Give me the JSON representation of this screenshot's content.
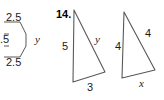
{
  "figure": {
    "kind": "geometry-diagram",
    "background_color": "#ffffff",
    "line_color": "#4d4d4d",
    "text_color": "#1a1a1a",
    "problem_number": "14."
  },
  "left_partial_figure": {
    "description": "polygon cropped by the left page edge",
    "labels": {
      "top_side": "2.5",
      "middle_side": ".5",
      "bottom_side": "2.5",
      "variable": "y"
    }
  },
  "triangle_one": {
    "labels": {
      "left_side": "5",
      "hypotenuse": "y",
      "base": "3"
    }
  },
  "triangle_two": {
    "labels": {
      "left_side": "4",
      "right_side": "4",
      "base": "x"
    }
  }
}
